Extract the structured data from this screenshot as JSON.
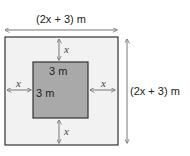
{
  "diagram": {
    "top_label": "(2x + 3) m",
    "right_label": "(2x + 3) m",
    "inner_top_label": "3 m",
    "inner_left_label": "3 m",
    "gap_top": "x",
    "gap_bottom": "x",
    "gap_left": "x",
    "gap_right": "x",
    "colors": {
      "outer_fill": "#f2f2f2",
      "inner_fill": "#a9a9a9",
      "border": "#333333",
      "arrow": "#777777"
    }
  }
}
